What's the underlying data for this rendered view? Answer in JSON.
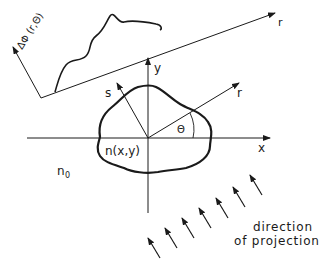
{
  "diagram": {
    "labels": {
      "phase_axis": "ΔΦ (r,Θ)",
      "projection_r_axis": "r",
      "y_axis": "y",
      "x_axis": "x",
      "s_axis": "s",
      "r_axis": "r",
      "angle": "Θ",
      "object": "n(x,y)",
      "surrounding": "n",
      "surrounding_subscript": "0",
      "projection_line1": "direction",
      "projection_line2": "of projection"
    },
    "colors": {
      "ink": "#1a1a1a",
      "background": "#ffffff"
    },
    "projection_arrows_count": 7
  }
}
